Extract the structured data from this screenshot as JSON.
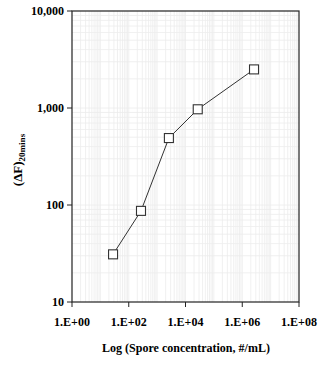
{
  "chart_data": {
    "type": "line",
    "title": "",
    "xlabel": "Log (Spore concentration, #/mL)",
    "ylabel": "(ΔF)",
    "ylabel_subscript": "20mins",
    "xscale": "log",
    "yscale": "log",
    "xlim": [
      1,
      100000000
    ],
    "ylim": [
      10,
      10000
    ],
    "x_ticks": [
      1,
      100,
      10000,
      1000000,
      100000000
    ],
    "x_tick_labels": [
      "1.E+00",
      "1.E+02",
      "1.E+04",
      "1.E+06",
      "1.E+08"
    ],
    "y_ticks": [
      10,
      100,
      1000,
      10000
    ],
    "y_tick_labels": [
      "10",
      "100",
      "1,000",
      "10,000"
    ],
    "grid": true,
    "legend": null,
    "series": [
      {
        "name": "ΔF 20mins",
        "marker": "open-square",
        "x": [
          28,
          270,
          2600,
          27000,
          2600000
        ],
        "values": [
          31,
          87,
          490,
          970,
          2500
        ]
      }
    ]
  }
}
